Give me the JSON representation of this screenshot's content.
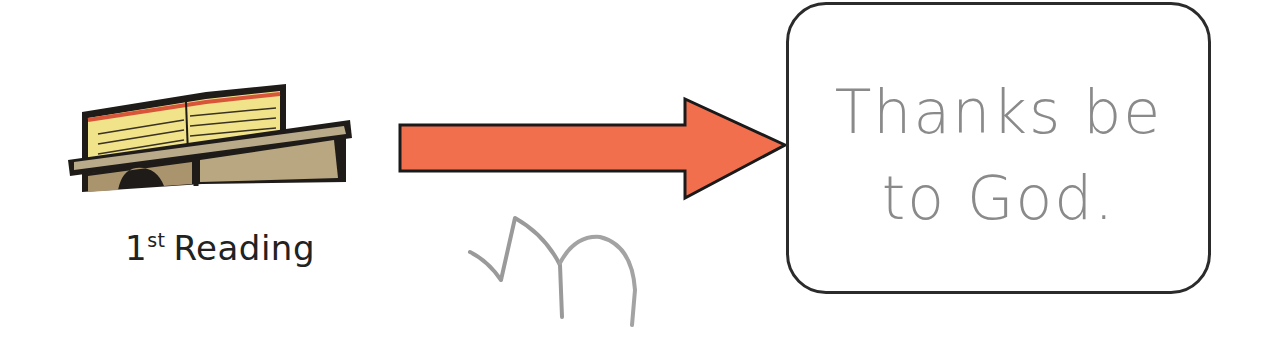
{
  "card": {
    "caption_number": "1",
    "caption_superscript": "st",
    "caption_label": "Reading",
    "icon": "lectern-open-book-icon"
  },
  "arrow": {
    "icon": "arrow-right-icon",
    "fill": "#f26f4e",
    "stroke": "#1a1a1a"
  },
  "scribble": {
    "icon": "pencil-scribble-mark",
    "color": "#9a9a9a"
  },
  "response": {
    "line1": "Thanks be",
    "line2": "to God.",
    "text_color": "#8a8a8a",
    "border_color": "#2b2b2b"
  }
}
